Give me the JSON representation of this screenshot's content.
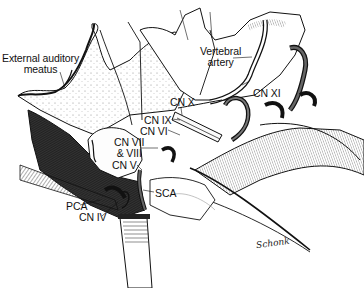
{
  "figure": {
    "type": "anatomical-illustration",
    "signature": "Schonk"
  },
  "labels": [
    {
      "id": "external-auditory-meatus",
      "text_line1": "External auditory",
      "text_line2": "meatus",
      "x": 2,
      "y": 53
    },
    {
      "id": "vertebral-artery",
      "text_line1": "Vertebral",
      "text_line2": "artery",
      "x": 200,
      "y": 46
    },
    {
      "id": "cn-xi",
      "text": "CN XI",
      "x": 253,
      "y": 88
    },
    {
      "id": "cn-x",
      "text": "CN X",
      "x": 170,
      "y": 97
    },
    {
      "id": "cn-ix",
      "text": "CN IX",
      "x": 144,
      "y": 115
    },
    {
      "id": "cn-vi",
      "text": "CN VI",
      "x": 140,
      "y": 126
    },
    {
      "id": "cn-vii-viii",
      "text_line1": "CN VII",
      "text_line2": "& VIII",
      "x": 114,
      "y": 137
    },
    {
      "id": "cn-v",
      "text": "CN V",
      "x": 112,
      "y": 160
    },
    {
      "id": "sca",
      "text": "SCA",
      "x": 155,
      "y": 188
    },
    {
      "id": "pca",
      "text": "PCA",
      "x": 66,
      "y": 201
    },
    {
      "id": "cn-iv",
      "text": "CN IV",
      "x": 79,
      "y": 212
    }
  ],
  "colors": {
    "ink": "#111111",
    "background": "#ffffff",
    "shade": "#3a3a3a"
  }
}
